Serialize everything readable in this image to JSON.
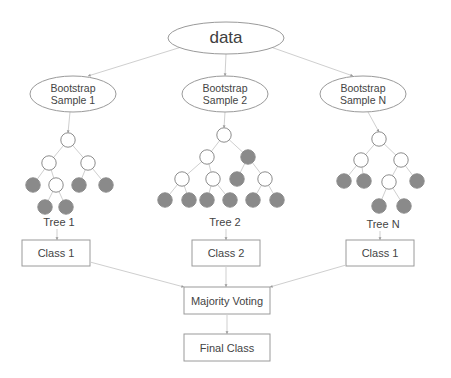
{
  "diagram": {
    "colors": {
      "node_fill": "#8a8a8a",
      "node_stroke": "#8c8c8c",
      "empty_fill": "#ffffff",
      "edge": "#cfcfcf",
      "box_stroke": "#9a9a9a",
      "text": "#444444"
    },
    "root": {
      "label": "data",
      "cx": 226,
      "cy": 38,
      "rx": 58,
      "ry": 16
    },
    "samples": [
      {
        "label_line1": "Bootstrap",
        "label_line2": "Sample 1",
        "cx": 73,
        "cy": 94,
        "rx": 43,
        "ry": 18
      },
      {
        "label_line1": "Bootstrap",
        "label_line2": "Sample 2",
        "cx": 225,
        "cy": 94,
        "rx": 43,
        "ry": 18
      },
      {
        "label_line1": "Bootstrap",
        "label_line2": "Sample N",
        "cx": 363,
        "cy": 94,
        "rx": 43,
        "ry": 18
      }
    ],
    "trees": [
      {
        "label": "Tree 1",
        "label_x": 59,
        "label_y": 222,
        "nodes": [
          {
            "x": 68,
            "y": 140,
            "filled": false
          },
          {
            "x": 49,
            "y": 163,
            "filled": false
          },
          {
            "x": 88,
            "y": 163,
            "filled": false
          },
          {
            "x": 33,
            "y": 185,
            "filled": true
          },
          {
            "x": 56,
            "y": 185,
            "filled": false
          },
          {
            "x": 79,
            "y": 185,
            "filled": true
          },
          {
            "x": 106,
            "y": 185,
            "filled": true
          },
          {
            "x": 45,
            "y": 207,
            "filled": true
          },
          {
            "x": 66,
            "y": 207,
            "filled": true
          }
        ],
        "edges": [
          [
            0,
            1
          ],
          [
            0,
            2
          ],
          [
            1,
            3
          ],
          [
            1,
            4
          ],
          [
            2,
            5
          ],
          [
            2,
            6
          ],
          [
            4,
            7
          ],
          [
            4,
            8
          ]
        ]
      },
      {
        "label": "Tree 2",
        "label_x": 225,
        "label_y": 222,
        "nodes": [
          {
            "x": 224,
            "y": 135,
            "filled": false
          },
          {
            "x": 207,
            "y": 157,
            "filled": false
          },
          {
            "x": 248,
            "y": 157,
            "filled": true
          },
          {
            "x": 182,
            "y": 179,
            "filled": false
          },
          {
            "x": 213,
            "y": 179,
            "filled": false
          },
          {
            "x": 237,
            "y": 179,
            "filled": true
          },
          {
            "x": 265,
            "y": 179,
            "filled": false
          },
          {
            "x": 165,
            "y": 200,
            "filled": true
          },
          {
            "x": 189,
            "y": 200,
            "filled": true
          },
          {
            "x": 207,
            "y": 200,
            "filled": true
          },
          {
            "x": 230,
            "y": 200,
            "filled": true
          },
          {
            "x": 253,
            "y": 200,
            "filled": true
          },
          {
            "x": 277,
            "y": 200,
            "filled": true
          }
        ],
        "edges": [
          [
            0,
            1
          ],
          [
            0,
            2
          ],
          [
            1,
            3
          ],
          [
            1,
            4
          ],
          [
            2,
            5
          ],
          [
            2,
            6
          ],
          [
            3,
            7
          ],
          [
            3,
            8
          ],
          [
            4,
            9
          ],
          [
            4,
            10
          ],
          [
            6,
            11
          ],
          [
            6,
            12
          ]
        ]
      },
      {
        "label": "Tree N",
        "label_x": 383,
        "label_y": 224,
        "nodes": [
          {
            "x": 379,
            "y": 139,
            "filled": false
          },
          {
            "x": 361,
            "y": 160,
            "filled": false
          },
          {
            "x": 401,
            "y": 160,
            "filled": false
          },
          {
            "x": 344,
            "y": 181,
            "filled": true
          },
          {
            "x": 364,
            "y": 181,
            "filled": true
          },
          {
            "x": 389,
            "y": 182,
            "filled": false
          },
          {
            "x": 417,
            "y": 181,
            "filled": true
          },
          {
            "x": 379,
            "y": 206,
            "filled": true
          },
          {
            "x": 404,
            "y": 206,
            "filled": true
          }
        ],
        "edges": [
          [
            0,
            1
          ],
          [
            0,
            2
          ],
          [
            1,
            3
          ],
          [
            1,
            4
          ],
          [
            2,
            5
          ],
          [
            2,
            6
          ],
          [
            5,
            7
          ],
          [
            5,
            8
          ]
        ]
      }
    ],
    "classes": [
      {
        "label": "Class 1",
        "x": 22,
        "y": 240,
        "w": 68,
        "h": 26
      },
      {
        "label": "Class 2",
        "x": 192,
        "y": 240,
        "w": 68,
        "h": 26
      },
      {
        "label": "Class 1",
        "x": 346,
        "y": 240,
        "w": 68,
        "h": 26
      }
    ],
    "majority": {
      "label": "Majority Voting",
      "x": 184,
      "y": 287,
      "w": 86,
      "h": 27
    },
    "final": {
      "label": "Final Class",
      "x": 184,
      "y": 334,
      "w": 86,
      "h": 27
    }
  }
}
